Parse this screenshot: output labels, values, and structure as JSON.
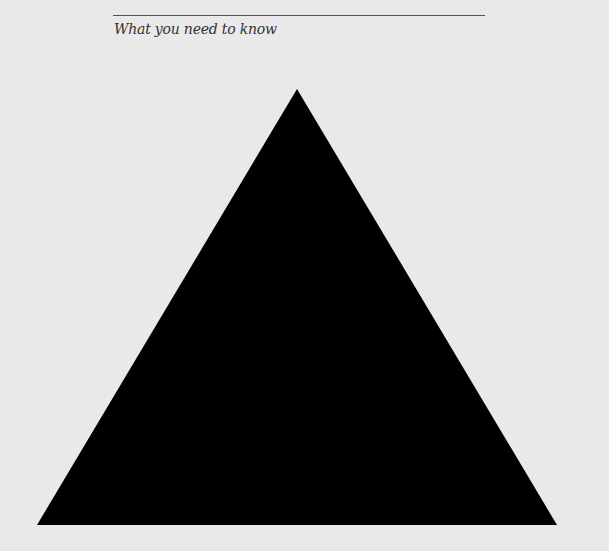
{
  "header": {
    "title": "What you need to know"
  },
  "figure": {
    "shape": "triangle",
    "fill_color": "#000000",
    "background_color": "#e9e9e9",
    "rule_color": "#555555"
  }
}
